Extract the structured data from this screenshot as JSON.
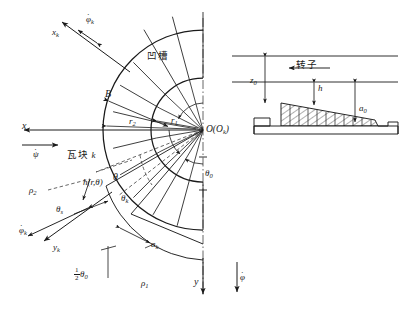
{
  "figure": {
    "colors": {
      "line": "#1a1a1a",
      "thin": "#4a4a4a",
      "background": "#ffffff",
      "hatch": "#1a1a1a"
    }
  },
  "main_view": {
    "center_label": "O(O",
    "center_label_sub": "k",
    "center_label_close": ")",
    "labels": {
      "groove": "凹槽",
      "pad": "瓦块",
      "pad_index": "k",
      "radius_outer": "r",
      "radius_outer_sub": "2",
      "radius_inner": "r",
      "radius_inner_sub": "1",
      "width_B": "B",
      "axis_x": "x",
      "axis_y": "y",
      "axis_xk": "x",
      "axis_xk_sub": "k",
      "axis_yk": "y",
      "axis_yk_sub": "k",
      "psi_dot": "ψ",
      "phi_dot": "φ",
      "phi_dot_k": "φ",
      "phi_dot_k_sub": "k",
      "phi_dot_k2": "φ",
      "phi_dot_k2_sub": "k",
      "theta": "θ",
      "theta_k": "θ",
      "theta_k_sub": "k",
      "theta_s": "θ",
      "theta_s_sub": "s",
      "theta_0": "θ",
      "theta_0_sub": "0",
      "half_theta_0_num": "1",
      "half_theta_0_den": "2",
      "half_theta_0_sym": "θ",
      "half_theta_0_sub": "0",
      "film_thickness": "h",
      "film_thickness_args": "(r,θ)",
      "rho_1": "ρ",
      "rho_1_sub": "1",
      "rho_2": "ρ",
      "rho_2_sub": "2",
      "a_k": "a",
      "a_k_sub": "k",
      "dot_glyph": "·"
    }
  },
  "inset_view": {
    "labels": {
      "rotor": "转子",
      "z_0": "z",
      "z_0_sub": "0",
      "h": "h",
      "a_0": "a",
      "a_0_sub": "0"
    }
  },
  "geometry": {
    "center_x": 203,
    "center_y": 130,
    "r_inner": 52,
    "r_outer": 100,
    "pad_count": 6,
    "groove_count": 6
  }
}
